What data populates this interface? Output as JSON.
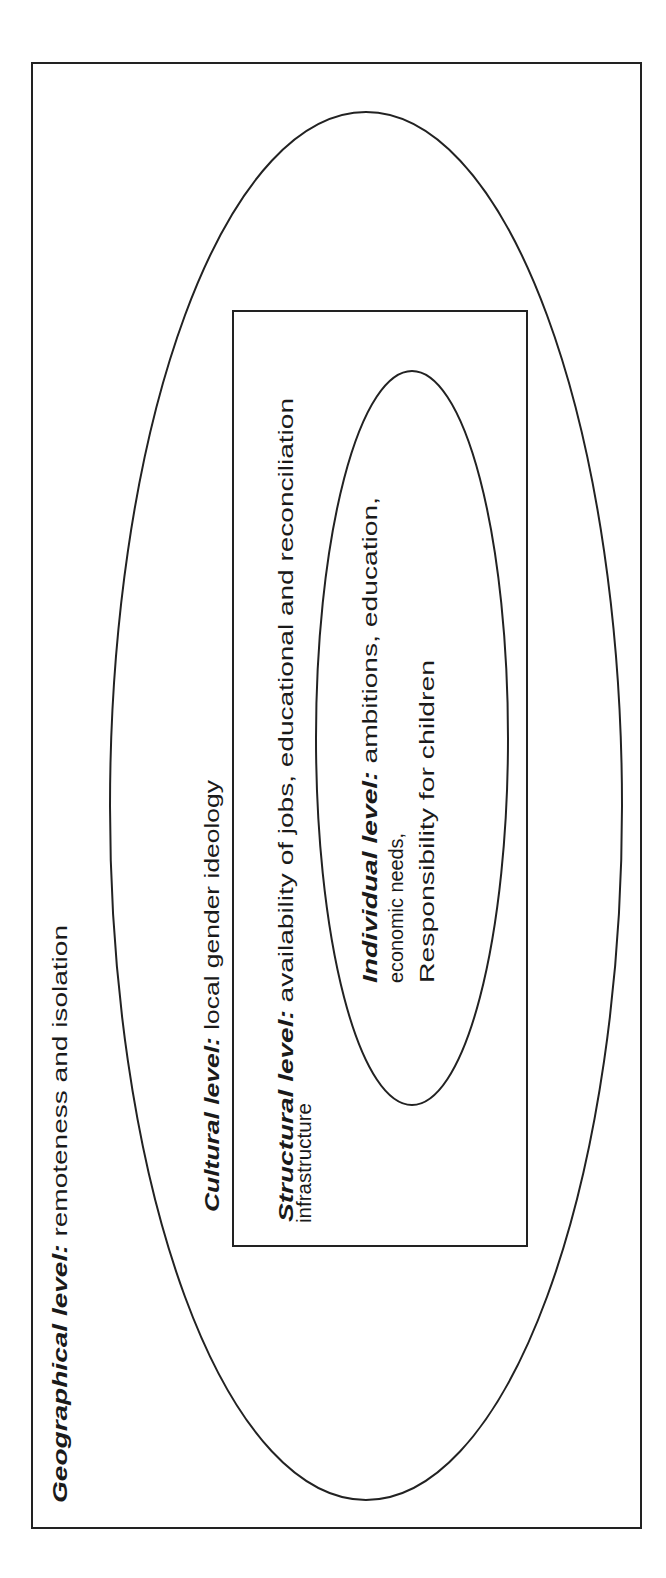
{
  "diagram": {
    "type": "nested-levels",
    "orientation": "rotated-90-ccw",
    "levels": [
      {
        "id": "geographical",
        "shape": "rectangle",
        "label": "Geographical level",
        "separator": ":",
        "description": " remoteness and isolation"
      },
      {
        "id": "cultural",
        "shape": "ellipse",
        "label": "Cultural level",
        "separator": ":",
        "description": " local gender ideology"
      },
      {
        "id": "structural",
        "shape": "rectangle",
        "label": "Structural level",
        "separator": ":",
        "description": " availability of jobs, educational and reconciliation",
        "description_line2": "infrastructure"
      },
      {
        "id": "individual",
        "shape": "ellipse",
        "label": "Individual level",
        "separator": ":",
        "description": " ambitions, education,",
        "description_line2": "economic needs,",
        "description_line3": "Responsibility for children"
      }
    ],
    "stroke_color": "#222222",
    "text_color": "#1a1a1a",
    "background": "#ffffff"
  }
}
